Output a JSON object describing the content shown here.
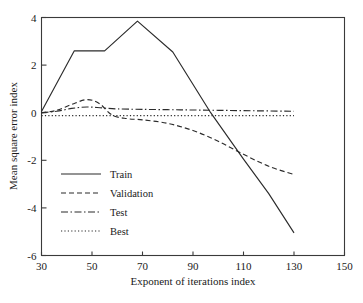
{
  "chart_data": {
    "type": "line",
    "title": "",
    "xlabel": "Exponent of iterations index",
    "ylabel": "Mean square error index",
    "xlim": [
      30,
      150
    ],
    "ylim": [
      -6,
      4
    ],
    "xticks": [
      30,
      50,
      70,
      90,
      110,
      130,
      150
    ],
    "yticks": [
      4,
      2,
      0,
      -2,
      -4,
      -6
    ],
    "xtick_labels": [
      "30",
      "50",
      "70",
      "90",
      "110",
      "130",
      "150"
    ],
    "ytick_labels": [
      "4",
      "2",
      "0",
      "-2",
      "-4",
      "-6"
    ],
    "grid": false,
    "legend_position": "center-left",
    "series": [
      {
        "name": "Train",
        "style": "solid",
        "x": [
          30,
          43,
          55,
          68,
          82,
          97,
          110,
          120,
          130
        ],
        "y": [
          0.05,
          2.6,
          2.6,
          3.85,
          2.55,
          0.0,
          -1.95,
          -3.4,
          -5.05
        ]
      },
      {
        "name": "Validation",
        "style": "dashed",
        "x": [
          30,
          36,
          42,
          48,
          53,
          58,
          64,
          70,
          80,
          90,
          100,
          110,
          120,
          130
        ],
        "y": [
          0.0,
          0.1,
          0.35,
          0.55,
          0.38,
          -0.1,
          -0.25,
          -0.3,
          -0.45,
          -0.75,
          -1.2,
          -1.75,
          -2.25,
          -2.6
        ]
      },
      {
        "name": "Test",
        "style": "dashdot",
        "x": [
          30,
          36,
          42,
          48,
          54,
          60,
          70,
          85,
          100,
          115,
          130
        ],
        "y": [
          0.0,
          0.06,
          0.18,
          0.24,
          0.2,
          0.16,
          0.14,
          0.12,
          0.1,
          0.08,
          0.06
        ]
      },
      {
        "name": "Best",
        "style": "dotted",
        "x": [
          30,
          50,
          70,
          90,
          110,
          130
        ],
        "y": [
          -0.12,
          -0.12,
          -0.12,
          -0.12,
          -0.12,
          -0.12
        ]
      }
    ]
  },
  "legend": {
    "entries": [
      {
        "label": "Train",
        "style": "solid"
      },
      {
        "label": "Validation",
        "style": "dashed"
      },
      {
        "label": "Test",
        "style": "dashdot"
      },
      {
        "label": "Best",
        "style": "dotted"
      }
    ]
  },
  "colors": {
    "line": "#2b2b2b",
    "axis": "#3a3a3a",
    "background": "#ffffff"
  }
}
